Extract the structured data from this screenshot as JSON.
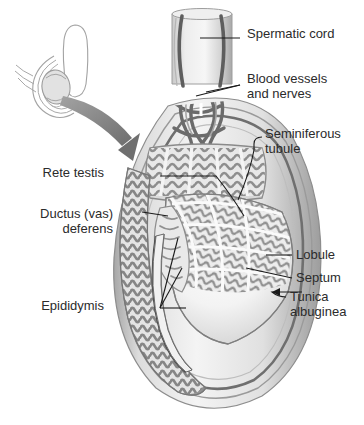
{
  "figure": {
    "type": "anatomical-illustration",
    "background_color": "#ffffff",
    "text_color": "#2b2b2b",
    "leader_color": "#1a1a1a",
    "palette": {
      "outline": "#8d8d8d",
      "tunica_outer": "#b9b9b9",
      "tunica_mid": "#9a9a9a",
      "tunica_dark": "#6f6f6f",
      "tubule_gray": "#909090",
      "tubule_light": "#c9c9c9",
      "lumen_pale": "#f2f2f2",
      "testis_body": "#f7f7f7",
      "cord_light": "#e3e3e3",
      "vessel_dark": "#5e5e5e",
      "arrow_gray": "#8a8a8a",
      "inset_line": "#9c9c9c",
      "inset_fill": "#e2e2e2"
    }
  },
  "labels": [
    {
      "id": "spermatic-cord",
      "text": "Spermatic cord",
      "side": "right",
      "x": 247,
      "y": 33
    },
    {
      "id": "blood-vessels",
      "text": "Blood vessels\nand nerves",
      "side": "right",
      "x": 247,
      "y": 78
    },
    {
      "id": "seminiferous",
      "text": "Seminiferous\ntubule",
      "side": "right",
      "x": 265,
      "y": 133
    },
    {
      "id": "lobule",
      "text": "Lobule",
      "side": "right",
      "x": 295,
      "y": 252
    },
    {
      "id": "septum",
      "text": "Septum",
      "side": "right",
      "x": 295,
      "y": 275
    },
    {
      "id": "tunica-albuginea",
      "text": "Tunica\nalbuginea",
      "side": "right",
      "x": 289,
      "y": 295
    },
    {
      "id": "rete-testis",
      "text": "Rete testis",
      "side": "left",
      "x": 104,
      "y": 172
    },
    {
      "id": "ductus-deferens",
      "text": "Ductus (vas)\ndeferens",
      "side": "left",
      "x": 113,
      "y": 213
    },
    {
      "id": "epididymis",
      "text": "Epididymis",
      "side": "left",
      "x": 104,
      "y": 305
    }
  ],
  "structures": [
    "spermatic cord",
    "blood vessels and nerves",
    "seminiferous tubule",
    "lobule",
    "septum",
    "tunica albuginea",
    "rete testis",
    "ductus (vas) deferens",
    "epididymis"
  ],
  "inset": {
    "id": "orientation-inset",
    "description": "line drawing of scrotum and penis with shaded testis"
  },
  "arrow": {
    "id": "zoom-arrow",
    "description": "curved gray arrow from inset to main figure"
  }
}
